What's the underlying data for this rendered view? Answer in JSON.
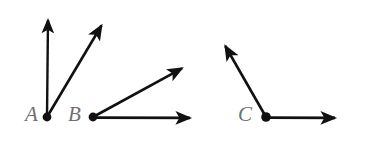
{
  "figure": {
    "background_color": "#ffffff",
    "stroke_color": "#111111",
    "label_color": "#6f6f6f",
    "width": 376,
    "height": 147,
    "angles": [
      {
        "id": "angle-a",
        "vertex_label": "A",
        "vertex": {
          "x": 47,
          "y": 117
        },
        "label_position": {
          "x": 25,
          "y": 104
        },
        "rays": [
          {
            "id": "ray-a-vertical",
            "name": "vertical-ray",
            "from": {
              "x": 47,
              "y": 117
            },
            "to": {
              "x": 48,
              "y": 15
            },
            "arrowhead": true
          },
          {
            "id": "ray-a-diagonal",
            "name": "diagonal-ray",
            "from": {
              "x": 47,
              "y": 117
            },
            "to": {
              "x": 105,
              "y": 19
            },
            "arrowhead": true
          }
        ]
      },
      {
        "id": "angle-b",
        "vertex_label": "B",
        "vertex": {
          "x": 93,
          "y": 117
        },
        "label_position": {
          "x": 68,
          "y": 104
        },
        "rays": [
          {
            "id": "ray-b-diagonal",
            "name": "diagonal-ray",
            "from": {
              "x": 93,
              "y": 117
            },
            "to": {
              "x": 188,
              "y": 65
            },
            "arrowhead": true
          },
          {
            "id": "ray-b-horizontal",
            "name": "horizontal-ray",
            "from": {
              "x": 93,
              "y": 117
            },
            "to": {
              "x": 197,
              "y": 118
            },
            "arrowhead": true
          }
        ]
      },
      {
        "id": "angle-c",
        "vertex_label": "C",
        "vertex": {
          "x": 266,
          "y": 117
        },
        "label_position": {
          "x": 238,
          "y": 104
        },
        "rays": [
          {
            "id": "ray-c-upper-left",
            "name": "upper-left-ray",
            "from": {
              "x": 266,
              "y": 117
            },
            "to": {
              "x": 221,
              "y": 39
            },
            "arrowhead": true
          },
          {
            "id": "ray-c-horizontal",
            "name": "horizontal-ray",
            "from": {
              "x": 266,
              "y": 117
            },
            "to": {
              "x": 342,
              "y": 118
            },
            "arrowhead": true
          }
        ]
      }
    ]
  }
}
